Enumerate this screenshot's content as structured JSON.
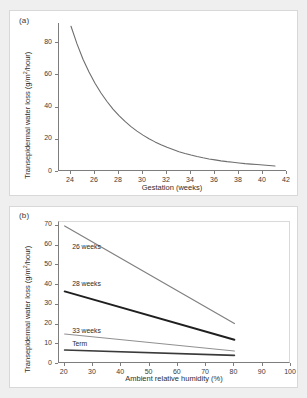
{
  "figure": {
    "background_color": "#efefef",
    "panel_background": "#ffffff"
  },
  "panels": [
    {
      "label": "(a)",
      "ylabel": "Transepidermal water loss (g/m2/hour)",
      "xlabel": "Gestation (weeks)"
    },
    {
      "label": "(b)",
      "ylabel": "Transepidermal water loss (g/m2/hour)",
      "xlabel": "Ambient relative humidity (%)"
    }
  ],
  "chart_data": [
    {
      "type": "line",
      "title": "",
      "panel": "(a)",
      "xlabel": "Gestation (weeks)",
      "ylabel": "Transepidermal water loss (g/m2/hour)",
      "xlim": [
        23,
        42
      ],
      "ylim": [
        0,
        92
      ],
      "xticks": [
        24,
        26,
        28,
        30,
        32,
        34,
        36,
        38,
        40,
        42
      ],
      "yticks": [
        0,
        20,
        40,
        60,
        80
      ],
      "grid": false,
      "legend": "none",
      "series": [
        {
          "name": "Transepidermal water loss vs gestation",
          "color": "#6e6e6e",
          "width": 1.1,
          "x": [
            24,
            24.5,
            25,
            25.5,
            26,
            26.5,
            27,
            27.5,
            28,
            28.5,
            29,
            29.5,
            30,
            30.5,
            31,
            31.5,
            32,
            32.5,
            33,
            33.5,
            34,
            34.5,
            35,
            35.5,
            36,
            36.5,
            37,
            37.5,
            38,
            38.5,
            39,
            39.5,
            40,
            40.5,
            41
          ],
          "values": [
            90,
            79,
            69.5,
            61.5,
            54.5,
            48.5,
            43.2,
            38.5,
            34.4,
            30.8,
            27.6,
            24.8,
            22.3,
            20.1,
            18.1,
            16.3,
            14.7,
            13.3,
            12.0,
            10.9,
            9.9,
            9.0,
            8.2,
            7.5,
            6.9,
            6.3,
            5.8,
            5.4,
            5.0,
            4.6,
            4.3,
            4.0,
            3.7,
            3.4,
            3.1
          ]
        }
      ]
    },
    {
      "type": "line",
      "title": "",
      "panel": "(b)",
      "xlabel": "Ambient relative humidity (%)",
      "ylabel": "Transepidermal water loss (g/m2/hour)",
      "xlim": [
        18,
        100
      ],
      "ylim": [
        0,
        72
      ],
      "xticks": [
        20,
        30,
        40,
        50,
        60,
        70,
        80,
        90,
        100
      ],
      "yticks": [
        0,
        10,
        20,
        30,
        40,
        50,
        60,
        70
      ],
      "grid": false,
      "legend": "inline-labels",
      "x": [
        20,
        80
      ],
      "series": [
        {
          "name": "26 weeks",
          "color": "#808080",
          "width": 1.2,
          "values": [
            70,
            20.5
          ],
          "label_x": 23,
          "label_y": 59
        },
        {
          "name": "28 weeks",
          "color": "#1f1f1f",
          "width": 1.9,
          "values": [
            36.8,
            12.3
          ],
          "label_x": 23,
          "label_y": 40
        },
        {
          "name": "33 weeks",
          "color": "#909090",
          "width": 1.2,
          "values": [
            15.2,
            6.6
          ],
          "label_x": 23,
          "label_y": 16
        },
        {
          "name": "Term",
          "color": "#3a3a3a",
          "width": 1.7,
          "values": [
            7.1,
            4.4
          ],
          "label_x": 23,
          "label_y": 9.6
        }
      ]
    }
  ]
}
